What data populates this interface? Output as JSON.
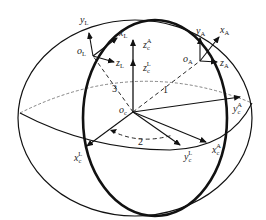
{
  "figure": {
    "colors": {
      "line": "#111111",
      "dashed": "#666666",
      "background": "#ffffff"
    }
  },
  "labels": {
    "yL": {
      "base": "y",
      "sub": "L"
    },
    "xL": {
      "base": "x",
      "sub": "L"
    },
    "oL": {
      "base": "o",
      "sub": "L"
    },
    "zL": {
      "base": "z",
      "sub": "L"
    },
    "zcA": {
      "base": "z",
      "sub": "c",
      "sup": "A"
    },
    "zcL": {
      "base": "z",
      "sub": "c",
      "sup": "L"
    },
    "yA": {
      "base": "y",
      "sub": "A"
    },
    "xA": {
      "base": "x",
      "sub": "A"
    },
    "oA": {
      "base": "o",
      "sub": "A"
    },
    "zA": {
      "base": "z",
      "sub": "A"
    },
    "oc": {
      "base": "o",
      "sub": "c"
    },
    "ycA": {
      "base": "y",
      "sub": "c",
      "sup": "A"
    },
    "xcL": {
      "base": "x",
      "sub": "c",
      "sup": "L"
    },
    "ycL": {
      "base": "y",
      "sub": "c",
      "sup": "L"
    },
    "xcA": {
      "base": "x",
      "sub": "c",
      "sup": "A"
    }
  },
  "angles": {
    "a1": "1",
    "a2": "2",
    "a3": "3"
  }
}
